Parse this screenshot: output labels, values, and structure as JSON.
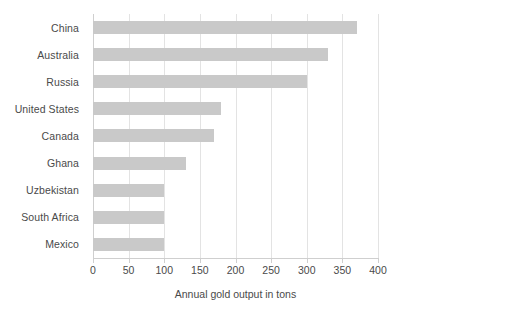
{
  "chart_data": {
    "type": "bar",
    "orientation": "horizontal",
    "title": "",
    "xlabel": "Annual gold output in tons",
    "ylabel": "",
    "categories": [
      "China",
      "Australia",
      "Russia",
      "United States",
      "Canada",
      "Ghana",
      "Uzbekistan",
      "South Africa",
      "Mexico"
    ],
    "values": [
      370,
      330,
      300,
      180,
      170,
      130,
      100,
      100,
      100
    ],
    "xlim": [
      0,
      400
    ],
    "xticks": [
      0,
      50,
      100,
      150,
      200,
      250,
      300,
      350,
      400
    ],
    "xtick_labels": [
      "0",
      "50",
      "100",
      "150",
      "200",
      "250",
      "300",
      "350",
      "400"
    ],
    "grid": "vertical",
    "legend": "none",
    "bar_color": "#c9c9c9",
    "gridline_color": "#e3e3e3",
    "text_color": "#4a4a4a",
    "background": "#ffffff"
  }
}
